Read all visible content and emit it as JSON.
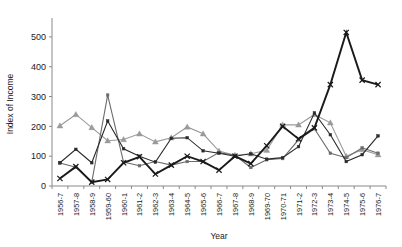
{
  "chart_data": {
    "type": "line",
    "title": "",
    "xlabel": "Year",
    "ylabel": "Index of Income",
    "ylim": [
      0,
      550
    ],
    "yticks": [
      0,
      100,
      200,
      300,
      400,
      500
    ],
    "grid": false,
    "legend": "none",
    "categories": [
      "1956-7",
      "1957-8",
      "1958-9",
      "1959-60",
      "1960-1",
      "1961-2",
      "1962-3",
      "1963-4",
      "1964-5",
      "1965-6",
      "1966-7",
      "1967-8",
      "1968-9",
      "1969-70",
      "1970-71",
      "1971-2",
      "1972-3",
      "1973-4",
      "1974-5",
      "1975-6",
      "1976-7"
    ],
    "series": [
      {
        "name": "series-1",
        "color": "#1a1a1a",
        "marker": "x",
        "width": 1.9,
        "values": [
          25,
          65,
          13,
          22,
          78,
          98,
          40,
          70,
          100,
          82,
          53,
          100,
          75,
          135,
          200,
          158,
          195,
          340,
          515,
          355,
          340
        ]
      },
      {
        "name": "series-2",
        "color": "#2b2b2b",
        "marker": "square",
        "width": 1.1,
        "values": [
          78,
          123,
          78,
          218,
          125,
          100,
          80,
          160,
          162,
          118,
          110,
          100,
          108,
          90,
          95,
          132,
          245,
          172,
          82,
          105,
          168
        ]
      },
      {
        "name": "series-3",
        "color": "#6b6b6b",
        "marker": "square",
        "width": 1.1,
        "values": [
          77,
          63,
          13,
          305,
          80,
          68,
          82,
          70,
          82,
          82,
          112,
          103,
          62,
          88,
          92,
          155,
          192,
          110,
          95,
          128,
          110
        ]
      },
      {
        "name": "series-4",
        "color": "#9a9a9a",
        "marker": "triangle",
        "width": 1.1,
        "values": [
          202,
          240,
          196,
          152,
          156,
          175,
          148,
          162,
          198,
          175,
          117,
          103,
          108,
          120,
          205,
          205,
          240,
          212,
          100,
          122,
          105
        ]
      }
    ]
  },
  "labels": {
    "y_axis_title": "Index of Income",
    "x_axis_title": "Year"
  }
}
